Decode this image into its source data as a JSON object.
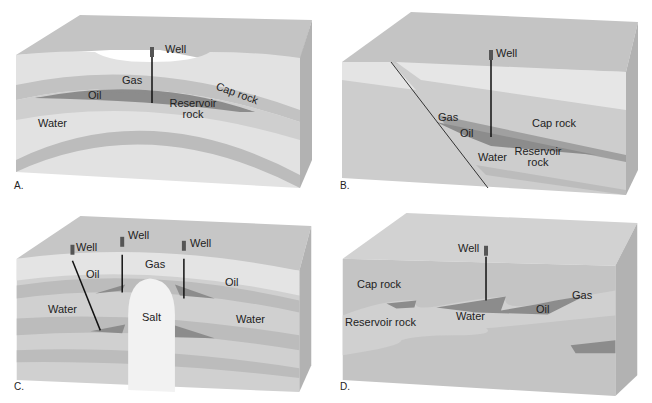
{
  "panels": [
    {
      "id": "A",
      "caption": "A.",
      "labels": {
        "well": "Well",
        "gas": "Gas",
        "oil": "Oil",
        "cap_rock": "Cap rock",
        "reservoir_rock": "Reservoir rock",
        "water": "Water"
      }
    },
    {
      "id": "B",
      "caption": "B.",
      "labels": {
        "well": "Well",
        "gas": "Gas",
        "oil": "Oil",
        "cap_rock": "Cap rock",
        "reservoir_rock": "Reservoir rock",
        "water": "Water"
      }
    },
    {
      "id": "C",
      "caption": "C.",
      "labels": {
        "well1": "Well",
        "well2": "Well",
        "well3": "Well",
        "gas": "Gas",
        "oil_left": "Oil",
        "oil_right": "Oil",
        "water_left": "Water",
        "water_right": "Water",
        "salt": "Salt"
      }
    },
    {
      "id": "D",
      "caption": "D.",
      "labels": {
        "well": "Well",
        "cap_rock": "Cap rock",
        "reservoir_rock": "Reservoir rock",
        "water": "Water",
        "oil": "Oil",
        "gas": "Gas"
      }
    }
  ],
  "colors": {
    "surface": "#c9c9c9",
    "cap": "#d6d6d6",
    "reservoir": "#bdbdbd",
    "oil": "#8a8a8a",
    "gas": "#a8a8a8",
    "water": "#cfcfcf",
    "salt": "#f2f2f2",
    "side": "#b5b5b5",
    "light": "#e6e6e6"
  }
}
